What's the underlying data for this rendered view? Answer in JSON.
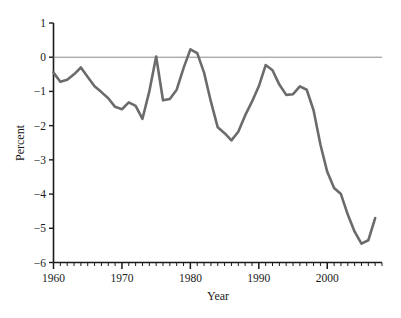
{
  "chart_data": {
    "type": "line",
    "title": "",
    "subtitle": "",
    "xlabel": "Year",
    "ylabel": "Percent",
    "xlim": [
      1960,
      2008
    ],
    "ylim": [
      -6,
      1
    ],
    "grid": false,
    "legend": null,
    "x_ticks_major": [
      1960,
      1970,
      1980,
      1990,
      2000
    ],
    "x_tick_labels": [
      "1960",
      "1970",
      "1980",
      "1990",
      "2000"
    ],
    "x_minor_tick_step": 1,
    "y_ticks": [
      1,
      0,
      -1,
      -2,
      -3,
      -4,
      -5,
      -6
    ],
    "y_tick_labels": [
      "1",
      "0",
      "−1",
      "−2",
      "−3",
      "−4",
      "−5",
      "−6"
    ],
    "series": [
      {
        "name": "Percent",
        "color": "#6b6b6b",
        "line_width": 2.6,
        "x": [
          1960,
          1961,
          1962,
          1963,
          1964,
          1965,
          1966,
          1967,
          1968,
          1969,
          1970,
          1971,
          1972,
          1973,
          1974,
          1975,
          1976,
          1977,
          1978,
          1979,
          1980,
          1981,
          1982,
          1983,
          1984,
          1985,
          1986,
          1987,
          1988,
          1989,
          1990,
          1991,
          1992,
          1993,
          1994,
          1995,
          1996,
          1997,
          1998,
          1999,
          2000,
          2001,
          2002,
          2003,
          2004,
          2005,
          2006,
          2007
        ],
        "values": [
          -0.45,
          -0.72,
          -0.66,
          -0.5,
          -0.3,
          -0.58,
          -0.85,
          -1.02,
          -1.2,
          -1.45,
          -1.52,
          -1.32,
          -1.42,
          -1.8,
          -1.0,
          0.02,
          -1.26,
          -1.22,
          -0.95,
          -0.32,
          0.23,
          0.12,
          -0.45,
          -1.3,
          -2.05,
          -2.22,
          -2.43,
          -2.18,
          -1.7,
          -1.3,
          -0.85,
          -0.23,
          -0.38,
          -0.8,
          -1.1,
          -1.08,
          -0.85,
          -0.95,
          -1.55,
          -2.55,
          -3.35,
          -3.82,
          -4.0,
          -4.6,
          -5.1,
          -5.45,
          -5.35,
          -4.7
        ]
      }
    ],
    "reference_lines": [
      {
        "name": "zero-line",
        "axis": "y",
        "value": 0,
        "color": "#8a8a8a",
        "width": 1
      }
    ]
  },
  "axes": {
    "y_axis_title": "Percent",
    "x_axis_title": "Year"
  }
}
